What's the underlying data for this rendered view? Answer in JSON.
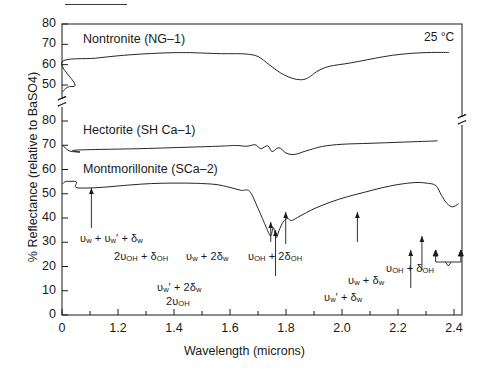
{
  "figure": {
    "top_rule": true,
    "temperature_note": "25 °C",
    "xlabel": "Wavelength (microns)",
    "ylabel": "% Reflectance (relative to BaSO4)"
  },
  "chart_data": {
    "type": "line",
    "title": "",
    "xlabel": "Wavelength (microns)",
    "ylabel": "% Reflectance (relative to BaSO4)",
    "xlim": [
      0,
      2.5
    ],
    "xticks": [
      0,
      1.2,
      1.4,
      1.6,
      1.8,
      2.0,
      2.2,
      2.4
    ],
    "xtick_labels": [
      "0",
      "1.2",
      "1.4",
      "1.6",
      "1.8",
      "2.0",
      "2.2",
      "2.4"
    ],
    "x_minor_ticks": [
      1.1,
      1.3,
      1.5,
      1.7,
      1.9,
      2.1,
      2.3,
      2.5
    ],
    "axis_break_x": 0.35,
    "grid": false,
    "legend": "inline-labels",
    "y_axis_note": "broken axis: upper panel 50-80 for Nontronite, lower panel 0-80 shared by Hectorite and Montmorillonite",
    "yticks_upper": [
      50,
      60,
      70,
      80
    ],
    "yticks_lower": [
      0,
      10,
      20,
      30,
      40,
      50,
      60,
      70,
      80
    ],
    "ylim_upper": [
      45,
      80
    ],
    "ylim_lower": [
      0,
      82
    ],
    "annotations": [
      {
        "label": "25 °C",
        "x": 2.33,
        "y_panel": "upper",
        "kind": "text"
      }
    ],
    "series": [
      {
        "name": "Nontronite (NG-1)",
        "panel": "upper",
        "label_x": 1.05,
        "label_y": 72,
        "points": [
          [
            0.02,
            46.8
          ],
          [
            0.05,
            47.8
          ],
          [
            0.08,
            48.5
          ],
          [
            0.14,
            49.2
          ],
          [
            0.25,
            50.5
          ],
          [
            0.4,
            52.2
          ],
          [
            0.55,
            54.4
          ],
          [
            0.7,
            56.8
          ],
          [
            0.85,
            59.2
          ],
          [
            1.0,
            61.4
          ],
          [
            1.12,
            63.2
          ],
          [
            1.22,
            64.6
          ],
          [
            1.32,
            65.5
          ],
          [
            1.4,
            65.9
          ],
          [
            1.46,
            65.9
          ],
          [
            1.52,
            65.6
          ],
          [
            1.57,
            65.4
          ],
          [
            1.62,
            65.4
          ],
          [
            1.66,
            65.2
          ],
          [
            1.7,
            64.0
          ],
          [
            1.74,
            60.0
          ],
          [
            1.78,
            56.0
          ],
          [
            1.82,
            53.4
          ],
          [
            1.855,
            52.6
          ],
          [
            1.88,
            53.6
          ],
          [
            1.91,
            56.6
          ],
          [
            1.94,
            58.6
          ],
          [
            1.97,
            59.6
          ],
          [
            2.01,
            60.4
          ],
          [
            2.06,
            61.6
          ],
          [
            2.12,
            63.2
          ],
          [
            2.18,
            64.6
          ],
          [
            2.25,
            65.6
          ],
          [
            2.32,
            66.0
          ],
          [
            2.38,
            66.0
          ],
          [
            2.44,
            65.9
          ],
          [
            2.5,
            65.8
          ]
        ]
      },
      {
        "name": "Nontronite right segment",
        "panel": "upper_right",
        "hidden_name": true,
        "points": []
      },
      {
        "name": "Hectorite (SH Ca-1)",
        "panel": "lower_upper",
        "label_x": 1.05,
        "label_y": 77,
        "points": [
          [
            0.02,
            69.8
          ],
          [
            0.06,
            69.0
          ],
          [
            0.12,
            67.9
          ],
          [
            0.2,
            67.4
          ],
          [
            0.35,
            67.2
          ],
          [
            0.55,
            67.3
          ],
          [
            0.8,
            67.6
          ],
          [
            1.05,
            68.0
          ],
          [
            1.28,
            68.6
          ],
          [
            1.45,
            69.2
          ],
          [
            1.56,
            69.6
          ],
          [
            1.62,
            69.9
          ],
          [
            1.66,
            69.6
          ],
          [
            1.69,
            70.2
          ],
          [
            1.71,
            68.6
          ],
          [
            1.735,
            69.8
          ],
          [
            1.75,
            67.4
          ],
          [
            1.775,
            69.0
          ],
          [
            1.8,
            66.8
          ],
          [
            1.83,
            66.2
          ],
          [
            1.87,
            67.6
          ],
          [
            1.93,
            69.5
          ],
          [
            2.0,
            70.4
          ],
          [
            2.1,
            70.8
          ],
          [
            2.22,
            71.3
          ],
          [
            2.34,
            71.8
          ],
          [
            2.44,
            72.2
          ],
          [
            2.5,
            72.4
          ]
        ]
      },
      {
        "name": "Montmorillonite (SCa-2)",
        "panel": "lower",
        "label_x": 1.05,
        "label_y": 60,
        "points": [
          [
            0.02,
            54.2
          ],
          [
            0.06,
            55.0
          ],
          [
            0.14,
            55.1
          ],
          [
            0.28,
            54.9
          ],
          [
            0.45,
            54.6
          ],
          [
            0.62,
            54.3
          ],
          [
            0.78,
            54.1
          ],
          [
            0.9,
            53.8
          ],
          [
            0.98,
            53.2
          ],
          [
            1.05,
            52.6
          ],
          [
            1.1,
            52.4
          ],
          [
            1.16,
            52.8
          ],
          [
            1.24,
            53.6
          ],
          [
            1.32,
            54.2
          ],
          [
            1.4,
            54.4
          ],
          [
            1.48,
            54.3
          ],
          [
            1.55,
            53.8
          ],
          [
            1.6,
            52.6
          ],
          [
            1.64,
            51.4
          ],
          [
            1.67,
            51.0
          ],
          [
            1.7,
            44.0
          ],
          [
            1.73,
            36.0
          ],
          [
            1.745,
            32.6
          ],
          [
            1.755,
            36.0
          ],
          [
            1.765,
            32.0
          ],
          [
            1.775,
            34.8
          ],
          [
            1.79,
            38.4
          ],
          [
            1.805,
            39.8
          ],
          [
            1.82,
            39.0
          ],
          [
            1.85,
            40.8
          ],
          [
            1.9,
            43.8
          ],
          [
            1.96,
            46.6
          ],
          [
            2.02,
            48.8
          ],
          [
            2.08,
            50.6
          ],
          [
            2.14,
            52.4
          ],
          [
            2.2,
            53.8
          ],
          [
            2.26,
            54.6
          ],
          [
            2.3,
            54.4
          ],
          [
            2.335,
            53.4
          ],
          [
            2.355,
            49.4
          ],
          [
            2.375,
            46.0
          ],
          [
            2.395,
            44.6
          ],
          [
            2.415,
            45.8
          ],
          [
            2.44,
            49.0
          ],
          [
            2.46,
            51.2
          ],
          [
            2.48,
            52.8
          ],
          [
            2.5,
            53.0
          ]
        ]
      }
    ],
    "band_annotations": [
      {
        "id": "a1",
        "text_parts": [
          [
            "v",
            "w"
          ],
          [
            "+"
          ],
          [
            "v'",
            "w"
          ],
          [
            "+"
          ],
          [
            "δ",
            "w"
          ]
        ],
        "plain": "υw + υ'w + δw",
        "arrow_x": 1.105,
        "arrow_top_y": 184,
        "arrow_bottom_y": 228
      },
      {
        "id": "a2",
        "plain": "2υOH + δOH",
        "arrow_x": 1.745,
        "arrow_top_y": 222,
        "arrow_bottom_y": 240
      },
      {
        "id": "a3",
        "plain": "υ'w + 2δw",
        "arrow_x": 1.762,
        "arrow_top_y": 232,
        "arrow_bottom_y": 272
      },
      {
        "id": "a4",
        "plain": "2υOH",
        "arrow_x": 1.762,
        "arrow_top_y": 232,
        "arrow_bottom_y": 272
      },
      {
        "id": "a5",
        "plain": "υw + 2δw",
        "arrow_x": 1.8,
        "arrow_top_y": 214,
        "arrow_bottom_y": 242
      },
      {
        "id": "a6",
        "plain": "υOH + 2δOH",
        "arrow_x": 2.055,
        "arrow_top_y": 214,
        "arrow_bottom_y": 240
      },
      {
        "id": "a7",
        "plain": "υ'w + δw",
        "arrow_x": 2.245,
        "arrow_top_y": 252,
        "arrow_bottom_y": 285
      },
      {
        "id": "a8",
        "plain": "υw + δw",
        "arrow_x": 2.285,
        "arrow_top_y": 238,
        "arrow_bottom_y": 272
      },
      {
        "id": "a9",
        "plain": "υOH + δOH",
        "arrow_x_left": 2.335,
        "arrow_x_right": 2.425,
        "bracket": true
      }
    ]
  },
  "ticks": {
    "upper_y": [
      "80",
      "70",
      "60",
      "50"
    ],
    "lower_y": [
      "80",
      "70",
      "60",
      "50",
      "40",
      "30",
      "20",
      "10",
      "0"
    ],
    "x": [
      "0",
      "1.2",
      "1.4",
      "1.6",
      "1.8",
      "2.0",
      "2.2",
      "2.4"
    ]
  },
  "labels": {
    "nontronite": "Nontronite (NG–1)",
    "hectorite": "Hectorite (SH Ca–1)",
    "montmorillonite": "Montmorillonite (SCa–2)",
    "temp": "25 °C",
    "xaxis": "Wavelength (microns)",
    "yaxis": "% Reflectance (relative to BaSO4)"
  },
  "ann_text": {
    "a1_pre": "υ",
    "a1": "υw + υ′w + δw",
    "a2": "2υOH + δOH",
    "a3": "υ′w + 2δw",
    "a4": "2υOH",
    "a5": "υw + 2δw",
    "a6": "υOH + 2δOH",
    "a7": "υ′w + δw",
    "a8": "υw + δw",
    "a9": "υOH + δOH"
  }
}
